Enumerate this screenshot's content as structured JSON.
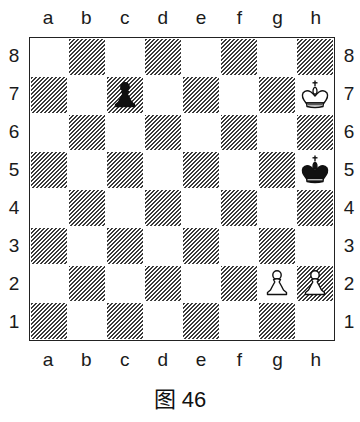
{
  "diagram": {
    "files": [
      "a",
      "b",
      "c",
      "d",
      "e",
      "f",
      "g",
      "h"
    ],
    "ranks": [
      "8",
      "7",
      "6",
      "5",
      "4",
      "3",
      "2",
      "1"
    ],
    "caption": "图 46",
    "board_colors": {
      "light": "#ffffff",
      "dark_hatch": "#3a3a3a",
      "border": "#222222"
    },
    "pieces": [
      {
        "square": "c7",
        "color": "black",
        "type": "pawn"
      },
      {
        "square": "h7",
        "color": "white",
        "type": "king"
      },
      {
        "square": "h5",
        "color": "black",
        "type": "king"
      },
      {
        "square": "g2",
        "color": "white",
        "type": "pawn"
      },
      {
        "square": "h2",
        "color": "white",
        "type": "pawn"
      }
    ]
  }
}
